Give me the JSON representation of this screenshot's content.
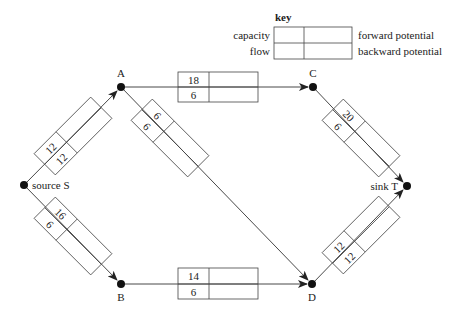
{
  "key": {
    "title": "key",
    "left_top": "capacity",
    "left_bottom": "flow",
    "right_top": "forward potential",
    "right_bottom": "backward potential"
  },
  "nodes": {
    "S": {
      "label": "source S",
      "x": 24,
      "y": 185
    },
    "A": {
      "label": "A",
      "x": 121,
      "y": 87
    },
    "B": {
      "label": "B",
      "x": 121,
      "y": 284
    },
    "C": {
      "label": "C",
      "x": 313,
      "y": 87
    },
    "D": {
      "label": "D",
      "x": 312,
      "y": 284
    },
    "T": {
      "label": "sink T",
      "x": 407,
      "y": 186
    }
  },
  "edges": {
    "SA": {
      "from": "S",
      "to": "A",
      "capacity": "12",
      "flow": "12",
      "forward_potential": "",
      "backward_potential": ""
    },
    "SB": {
      "from": "S",
      "to": "B",
      "capacity": "16",
      "flow": "6",
      "forward_potential": "",
      "backward_potential": ""
    },
    "AC": {
      "from": "A",
      "to": "C",
      "capacity": "18",
      "flow": "6",
      "forward_potential": "",
      "backward_potential": ""
    },
    "AD": {
      "from": "A",
      "to": "D",
      "capacity": "6",
      "flow": "6",
      "forward_potential": "",
      "backward_potential": ""
    },
    "BD": {
      "from": "B",
      "to": "D",
      "capacity": "14",
      "flow": "6",
      "forward_potential": "",
      "backward_potential": ""
    },
    "CT": {
      "from": "C",
      "to": "T",
      "capacity": "20",
      "flow": "6",
      "forward_potential": "",
      "backward_potential": ""
    },
    "DT": {
      "from": "D",
      "to": "T",
      "capacity": "12",
      "flow": "12",
      "forward_potential": "",
      "backward_potential": ""
    }
  },
  "colors": {
    "line": "#333333",
    "node": "#111111",
    "background": "#ffffff"
  }
}
